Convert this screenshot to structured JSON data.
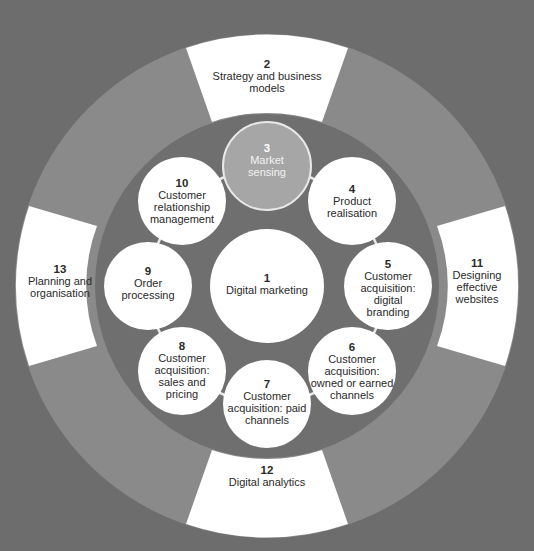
{
  "diagram": {
    "colors": {
      "background": "#6d6d6d",
      "outer_ring": "#8a8a8a",
      "inner_disc": "#6f6f6f",
      "node_fill": "#ffffff",
      "highlight_node": "#a6a6a6",
      "connector": "#e8e8e8"
    },
    "center": {
      "num": "1",
      "text": "Digital marketing"
    },
    "inner_nodes": [
      {
        "num": "3",
        "text": "Market sensing",
        "highlight": true
      },
      {
        "num": "4",
        "text": "Product realisation"
      },
      {
        "num": "5",
        "text": "Customer acquisition: digital branding"
      },
      {
        "num": "6",
        "text": "Customer acquisition: owned or earned channels"
      },
      {
        "num": "7",
        "text": "Customer acquisition: paid channels"
      },
      {
        "num": "8",
        "text": "Customer acquisition: sales and pricing"
      },
      {
        "num": "9",
        "text": "Order processing"
      },
      {
        "num": "10",
        "text": "Customer relationship management"
      }
    ],
    "outer_segments": [
      {
        "num": "2",
        "text": "Strategy and business models",
        "position": "top"
      },
      {
        "num": "11",
        "text": "Designing effective websites",
        "position": "right"
      },
      {
        "num": "12",
        "text": "Digital analytics",
        "position": "bottom"
      },
      {
        "num": "13",
        "text": "Planning and organisation",
        "position": "left"
      }
    ]
  }
}
